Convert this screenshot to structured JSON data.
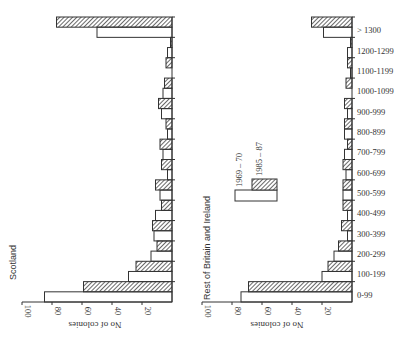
{
  "chart_data": [
    {
      "type": "bar",
      "orientation": "horizontal",
      "title": "Scotland",
      "xlabel": "No of colonies",
      "ylabel": "",
      "xlim": [
        0,
        100
      ],
      "x_ticks": [
        20,
        40,
        60,
        80,
        100
      ],
      "categories": [
        "0-99",
        "100-199",
        "200-299",
        "300-399",
        "400-499",
        "500-599",
        "600-699",
        "700-799",
        "800-899",
        "900-999",
        "1000-1099",
        "1100-1199",
        "1200-1299",
        "> 1300"
      ],
      "series": [
        {
          "name": "1969 – 70",
          "style": "open",
          "values": [
            85,
            29,
            14,
            12,
            11,
            8,
            3,
            6,
            3,
            7,
            6,
            0,
            3,
            50
          ]
        },
        {
          "name": "1985 – 87",
          "style": "hatched",
          "values": [
            59,
            24,
            10,
            13,
            7,
            11,
            7,
            8,
            4,
            9,
            5,
            4,
            1,
            77
          ]
        }
      ]
    },
    {
      "type": "bar",
      "orientation": "horizontal",
      "title": "Rest of Britain and Ireland",
      "xlabel": "No of colonies",
      "ylabel": "",
      "xlim": [
        0,
        100
      ],
      "x_ticks": [
        20,
        40,
        60,
        80,
        100
      ],
      "categories": [
        "0-99",
        "100-199",
        "200-299",
        "300-399",
        "400-499",
        "500-599",
        "600-699",
        "700-799",
        "800-899",
        "900-999",
        "1000-1099",
        "1100-1199",
        "1200-1299",
        "> 1300"
      ],
      "series": [
        {
          "name": "1969 – 70",
          "style": "open",
          "values": [
            74,
            20,
            12,
            3,
            3,
            6,
            4,
            5,
            5,
            3,
            0,
            1,
            3,
            19
          ]
        },
        {
          "name": "1985 – 87",
          "style": "hatched",
          "values": [
            69,
            16,
            9,
            7,
            6,
            6,
            6,
            3,
            5,
            5,
            4,
            3,
            1,
            27
          ]
        }
      ]
    }
  ],
  "legend": {
    "items": [
      {
        "label": "1969 – 70",
        "style": "open"
      },
      {
        "label": "1985 – 87",
        "style": "hatched"
      }
    ]
  },
  "panels": {
    "left": {
      "title": "Scotland",
      "axis_label": "No of colonies",
      "tick_labels": [
        "100",
        "80",
        "60",
        "40",
        "20"
      ]
    },
    "right": {
      "title": "Rest of Britain and Ireland",
      "axis_label": "No of colonies",
      "tick_labels": [
        "100",
        "80",
        "60",
        "40",
        "20"
      ]
    }
  },
  "colors": {
    "bar_edge": "#333333",
    "hatch": "#444444",
    "background": "#ffffff"
  }
}
